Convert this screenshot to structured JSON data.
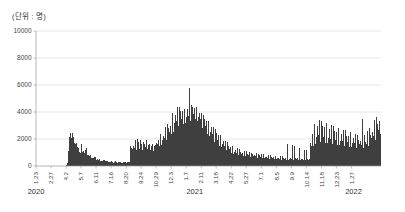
{
  "unit_label": "(단위 : 명)",
  "colors": {
    "bar": "#3f3f3f",
    "grid": "#d6d6d6",
    "axis": "#9a9a9a",
    "text": "#444444",
    "background": "#ffffff"
  },
  "chart_data": {
    "type": "bar",
    "title": "",
    "subtitle": "",
    "xlabel": "",
    "ylabel": "",
    "unit": "명",
    "grid": true,
    "legend": null,
    "ylim": [
      0,
      10000
    ],
    "yticks": [
      0,
      2000,
      4000,
      6000,
      8000,
      10000
    ],
    "ytick_labels": [
      "0",
      "2000",
      "4000",
      "6000",
      "8000",
      "10000"
    ],
    "xtick_labels": [
      "1.23",
      "2.27",
      "4.2",
      "5.7",
      "6.11",
      "7.16",
      "8.20",
      "9.24",
      "10.29",
      "12.3",
      "1.7",
      "2.11",
      "3.18",
      "4.22",
      "5.27",
      "7.1",
      "8.5",
      "9.9",
      "10.14",
      "11.18",
      "12.23",
      "1.27"
    ],
    "xtick_indices": [
      0,
      35,
      70,
      105,
      140,
      175,
      210,
      245,
      280,
      315,
      350,
      385,
      420,
      455,
      490,
      525,
      560,
      595,
      630,
      665,
      700,
      735
    ],
    "year_labels": [
      "2020",
      "2021",
      "2022"
    ],
    "year_positions": [
      0,
      370,
      740
    ],
    "n_points": 745,
    "series_name": "일일 확진자 수",
    "values": [
      0,
      0,
      0,
      0,
      0,
      0,
      0,
      0,
      0,
      0,
      0,
      0,
      0,
      0,
      0,
      0,
      0,
      0,
      0,
      0,
      0,
      0,
      0,
      0,
      0,
      0,
      0,
      0,
      0,
      0,
      0,
      0,
      0,
      0,
      0,
      0,
      0,
      0,
      0,
      0,
      0,
      0,
      0,
      0,
      0,
      0,
      0,
      0,
      0,
      0,
      0,
      0,
      0,
      0,
      0,
      0,
      0,
      0,
      0,
      0,
      0,
      0,
      0,
      0,
      0,
      0,
      0,
      0,
      0,
      0,
      20,
      60,
      120,
      240,
      430,
      700,
      1100,
      1700,
      2150,
      2500,
      2430,
      2700,
      2300,
      2050,
      6010,
      2480,
      2600,
      2150,
      1950,
      2250,
      1700,
      1450,
      1600,
      1320,
      1700,
      1500,
      1250,
      1400,
      1150,
      1300,
      1250,
      1050,
      1350,
      1180,
      950,
      1450,
      1600,
      1250,
      1050,
      1200,
      900,
      1100,
      1300,
      950,
      800,
      1150,
      1000,
      880,
      1300,
      1100,
      780,
      950,
      820,
      700,
      900,
      760,
      650,
      840,
      720,
      600,
      780,
      660,
      560,
      720,
      630,
      520,
      680,
      600,
      480,
      640,
      560,
      440,
      600,
      520,
      400,
      560,
      470,
      380,
      520,
      450,
      360,
      490,
      420,
      340,
      460,
      400,
      320,
      440,
      380,
      310,
      420,
      2500,
      360,
      300,
      400,
      350,
      290,
      380,
      340,
      280,
      370,
      330,
      270,
      360,
      320,
      265,
      350,
      310,
      260,
      345,
      305,
      255,
      340,
      300,
      250,
      335,
      295,
      245,
      330,
      290,
      240,
      325,
      285,
      238,
      320,
      280,
      235,
      318,
      278,
      232,
      315,
      275,
      230,
      312,
      272,
      228,
      310,
      270,
      226,
      308,
      268,
      224,
      306,
      266,
      222,
      304,
      264,
      220,
      302,
      262,
      1450,
      1600,
      1100,
      1350,
      1700,
      1250,
      950,
      1500,
      1800,
      1300,
      1050,
      1600,
      1900,
      1400,
      1150,
      1700,
      2000,
      1450,
      1200,
      1750,
      1500,
      1250,
      1600,
      1900,
      1350,
      1100,
      1650,
      1450,
      1200,
      1550,
      1750,
      1300,
      1050,
      1600,
      1850,
      1400,
      1150,
      1700,
      1950,
      1500,
      1250,
      1800,
      1550,
      1300,
      1650,
      1900,
      1400,
      1150,
      1700,
      1500,
      1250,
      1600,
      1850,
      1350,
      1100,
      1650,
      1450,
      1200,
      1550,
      1800,
      1300,
      1700,
      2100,
      1600,
      1350,
      1900,
      2200,
      1700,
      1450,
      2000,
      2400,
      1800,
      1550,
      2100,
      2500,
      1900,
      1650,
      2250,
      2700,
      2050,
      1750,
      2400,
      2900,
      2200,
      1900,
      2600,
      3100,
      2350,
      2050,
      2800,
      3400,
      2550,
      2200,
      3000,
      3600,
      2750,
      2400,
      3250,
      3900,
      2950,
      2550,
      3500,
      4200,
      3150,
      2750,
      3750,
      4400,
      3350,
      2900,
      3950,
      4350,
      3400,
      2950,
      4000,
      4400,
      3450,
      3000,
      4050,
      4400,
      3500,
      3050,
      4100,
      4300,
      3550,
      3100,
      4150,
      4250,
      3600,
      3150,
      4200,
      4300,
      3650,
      3200,
      4250,
      9150,
      3700,
      3250,
      4300,
      5800,
      3750,
      3300,
      4350,
      4500,
      3800,
      3350,
      4400,
      4550,
      3850,
      3400,
      4300,
      4600,
      3900,
      3450,
      4250,
      4400,
      3750,
      3300,
      4100,
      4250,
      3600,
      3150,
      3950,
      4100,
      3450,
      3000,
      3800,
      3950,
      3300,
      2850,
      3650,
      3800,
      3150,
      2700,
      3500,
      3650,
      3000,
      2550,
      3350,
      3500,
      2850,
      2400,
      3200,
      3350,
      2700,
      2250,
      3050,
      3200,
      2550,
      2100,
      2900,
      3050,
      2400,
      1950,
      2750,
      2900,
      2250,
      1800,
      2600,
      2750,
      2100,
      1700,
      2450,
      2600,
      1950,
      1600,
      2300,
      2450,
      1800,
      1500,
      2150,
      2300,
      1700,
      1400,
      2000,
      2150,
      1600,
      1300,
      1850,
      2000,
      1500,
      1200,
      1700,
      1850,
      1400,
      1150,
      1600,
      1750,
      1300,
      1100,
      1500,
      1650,
      1250,
      1050,
      1400,
      1550,
      1150,
      950,
      1300,
      1450,
      1100,
      900,
      1250,
      1400,
      1050,
      880,
      1200,
      1350,
      1000,
      850,
      1150,
      1300,
      980,
      820,
      1100,
      1250,
      950,
      800,
      1050,
      1200,
      920,
      780,
      1000,
      1150,
      900,
      760,
      980,
      1100,
      870,
      740,
      950,
      1080,
      850,
      720,
      920,
      1050,
      830,
      700,
      900,
      1020,
      810,
      690,
      880,
      1000,
      790,
      670,
      860,
      980,
      770,
      650,
      840,
      960,
      750,
      640,
      820,
      940,
      730,
      620,
      800,
      920,
      710,
      600,
      780,
      900,
      690,
      590,
      760,
      880,
      670,
      570,
      740,
      860,
      650,
      560,
      720,
      840,
      640,
      550,
      700,
      820,
      620,
      540,
      690,
      800,
      610,
      530,
      670,
      780,
      600,
      520,
      660,
      770,
      590,
      510,
      650,
      760,
      580,
      500,
      640,
      750,
      570,
      495,
      630,
      740,
      560,
      490,
      620,
      730,
      550,
      485,
      615,
      720,
      545,
      480,
      605,
      710,
      540,
      475,
      600,
      700,
      535,
      470,
      595,
      1750,
      530,
      465,
      590,
      1650,
      525,
      460,
      585,
      1700,
      520,
      455,
      580,
      1600,
      515,
      450,
      575,
      1550,
      510,
      445,
      570,
      1500,
      505,
      440,
      565,
      1450,
      500,
      435,
      560,
      1400,
      495,
      430,
      555,
      1350,
      490,
      425,
      550,
      1300,
      485,
      420,
      545,
      1250,
      480,
      415,
      540,
      1200,
      475,
      410,
      535,
      1150,
      470,
      405,
      530,
      1100,
      465,
      400,
      525,
      1050,
      460,
      1700,
      2100,
      1500,
      1300,
      2400,
      2900,
      1800,
      1500,
      2600,
      3100,
      2000,
      1650,
      2800,
      3300,
      2150,
      1750,
      2950,
      3500,
      2300,
      1850,
      3100,
      3400,
      2250,
      1800,
      3000,
      3350,
      2200,
      1780,
      2950,
      3300,
      2150,
      1750,
      2900,
      3250,
      2100,
      1720,
      2850,
      3200,
      2080,
      1700,
      2800,
      3150,
      2050,
      1680,
      2750,
      3100,
      2020,
      1660,
      2700,
      3050,
      2000,
      1640,
      2650,
      3000,
      1980,
      1620,
      2600,
      2950,
      1950,
      1600,
      2550,
      2900,
      1930,
      1580,
      2500,
      2850,
      1900,
      1560,
      2450,
      2800,
      1880,
      1540,
      2400,
      2750,
      1850,
      1520,
      2350,
      2700,
      1830,
      1500,
      2300,
      2650,
      1800,
      1480,
      2250,
      2600,
      1780,
      1460,
      2200,
      2550,
      1750,
      1440,
      2150,
      2500,
      1730,
      1420,
      2100,
      2450,
      1700,
      1400,
      2050,
      2400,
      1680,
      1380,
      2000,
      2350,
      1650,
      1360,
      1950,
      2300,
      1630,
      1350,
      1900,
      2250,
      1600,
      1340,
      1880,
      2200,
      1580,
      1330,
      1850,
      3500,
      1560,
      1320,
      1820,
      2300,
      1550,
      1310,
      1800,
      2400,
      1600,
      1350,
      1900,
      2600,
      1750,
      1450,
      2100,
      2800,
      1900,
      1550,
      2300,
      3000,
      2050,
      1650,
      2500,
      3200,
      2200,
      1750,
      2700,
      3400,
      2350,
      1900,
      2900,
      3600,
      2500,
      2050,
      3100,
      3800,
      2700,
      2200,
      3300,
      3900,
      2850,
      2400,
      3500
    ]
  }
}
